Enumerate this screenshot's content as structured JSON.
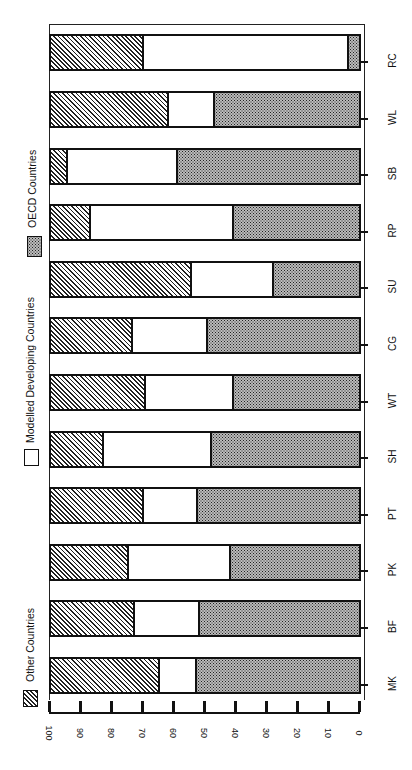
{
  "chart_data": {
    "type": "bar",
    "orientation": "stacked horizontal bars, figure rotated 90° (value axis runs 100→0 left to right, categories top to bottom RC→MK)",
    "title": "",
    "xlabel": "",
    "ylabel": "",
    "ylim": [
      0,
      100
    ],
    "value_ticks": [
      100,
      90,
      80,
      70,
      60,
      50,
      40,
      30,
      20,
      10,
      0
    ],
    "grid": false,
    "legend_position": "left (rotated, along the figure)",
    "categories": [
      "MK",
      "BF",
      "PK",
      "PT",
      "SH",
      "WT",
      "CG",
      "SU",
      "RP",
      "SB",
      "WL",
      "RC"
    ],
    "series": [
      {
        "name": "OECD Countries",
        "pattern": "dotted",
        "values": [
          53,
          52,
          42,
          52.5,
          48,
          41,
          49.5,
          28,
          41,
          59,
          47,
          4
        ]
      },
      {
        "name": "Modelled Developing Countries",
        "pattern": "white",
        "values": [
          12,
          21,
          33,
          17.5,
          35,
          28.5,
          24,
          26.5,
          46,
          35.5,
          15,
          66
        ]
      },
      {
        "name": "Other Countries",
        "pattern": "hatched",
        "values": [
          35,
          27,
          25,
          30,
          17,
          30.5,
          26.5,
          45.5,
          13,
          5.5,
          38,
          30
        ]
      }
    ]
  },
  "legend": [
    {
      "label": "Other Countries",
      "pattern": "hatched"
    },
    {
      "label": "Modelled Developing Countries",
      "pattern": "white"
    },
    {
      "label": "OECD Countries",
      "pattern": "dotted"
    }
  ],
  "colors": {
    "ink": "#111111",
    "background": "#ffffff",
    "dot_fill": "#bbbbbb"
  }
}
